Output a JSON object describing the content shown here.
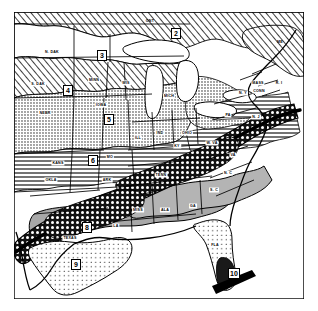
{
  "map": {
    "title": "Plant hardiness zone map of the eastern United States",
    "description": "Black and white line map of the central and eastern United States and southern Canada showing numbered climatic zones with hatch, stipple and gray fill patterns. A heavy dark band runs diagonally from Texas through the Appalachians to New England.",
    "style": "scanned black-and-white halftone map",
    "colors": {
      "background": "#ffffff",
      "ink": "#000000",
      "gray_light": "#d8d8d8",
      "gray_medium": "#a8a8a8",
      "gray_dark": "#7a7a7a",
      "water": "#ffffff"
    },
    "zones": [
      {
        "id": "zone-2",
        "label": "2",
        "region": "Ontario, Canada",
        "x": 172,
        "y": 25
      },
      {
        "id": "zone-3",
        "label": "3",
        "region": "North Dakota / northern plains",
        "x": 98,
        "y": 47
      },
      {
        "id": "zone-4",
        "label": "4",
        "region": "South Dakota / upper midwest",
        "x": 64,
        "y": 87
      },
      {
        "id": "zone-5",
        "label": "5",
        "region": "Iowa / central plains",
        "x": 104,
        "y": 120
      },
      {
        "id": "zone-6",
        "label": "6",
        "region": "Kansas / Missouri",
        "x": 89,
        "y": 159
      },
      {
        "id": "zone-7",
        "label": "7",
        "region": "Ontario northern band",
        "x": 172,
        "y": 25
      },
      {
        "id": "zone-8",
        "label": "8",
        "region": "East Texas",
        "x": 83,
        "y": 226
      },
      {
        "id": "zone-9",
        "label": "9",
        "region": "South Texas",
        "x": 72,
        "y": 262
      },
      {
        "id": "zone-10",
        "label": "10",
        "region": "South Florida",
        "x": 231,
        "y": 271
      }
    ],
    "zone_boxes": [
      {
        "label": "2",
        "x": 171,
        "y": 28
      },
      {
        "label": "3",
        "x": 97,
        "y": 50
      },
      {
        "label": "4",
        "x": 63,
        "y": 85
      },
      {
        "label": "5",
        "x": 104,
        "y": 114
      },
      {
        "label": "6",
        "x": 88,
        "y": 155
      },
      {
        "label": "8",
        "x": 82,
        "y": 222
      },
      {
        "label": "9",
        "x": 71,
        "y": 259
      },
      {
        "label": "10",
        "x": 228,
        "y": 268
      }
    ],
    "state_labels": [
      {
        "abbr": "N. DAK",
        "x": 52,
        "y": 52
      },
      {
        "abbr": "S. DAK",
        "x": 38,
        "y": 84
      },
      {
        "abbr": "MINN",
        "x": 94,
        "y": 80
      },
      {
        "abbr": "NEBR",
        "x": 45,
        "y": 113
      },
      {
        "abbr": "IOWA",
        "x": 101,
        "y": 105
      },
      {
        "abbr": "WIS",
        "x": 126,
        "y": 83
      },
      {
        "abbr": "MICH",
        "x": 169,
        "y": 96
      },
      {
        "abbr": "KANS",
        "x": 58,
        "y": 163
      },
      {
        "abbr": "MO",
        "x": 110,
        "y": 157
      },
      {
        "abbr": "OKLA",
        "x": 51,
        "y": 180
      },
      {
        "abbr": "ARK",
        "x": 107,
        "y": 180
      },
      {
        "abbr": "ILL",
        "x": 138,
        "y": 138
      },
      {
        "abbr": "IND",
        "x": 160,
        "y": 133
      },
      {
        "abbr": "OHIO",
        "x": 187,
        "y": 133
      },
      {
        "abbr": "KY",
        "x": 177,
        "y": 146
      },
      {
        "abbr": "W. VA",
        "x": 212,
        "y": 143
      },
      {
        "abbr": "PA",
        "x": 228,
        "y": 115
      },
      {
        "abbr": "TENN",
        "x": 161,
        "y": 175
      },
      {
        "abbr": "MISS",
        "x": 138,
        "y": 210
      },
      {
        "abbr": "ALA",
        "x": 165,
        "y": 210
      },
      {
        "abbr": "GA",
        "x": 193,
        "y": 206
      },
      {
        "abbr": "LA",
        "x": 116,
        "y": 226
      },
      {
        "abbr": "TEXAS",
        "x": 70,
        "y": 238
      },
      {
        "abbr": "FLA",
        "x": 215,
        "y": 245
      },
      {
        "abbr": "S. C",
        "x": 214,
        "y": 190
      },
      {
        "abbr": "N. C",
        "x": 228,
        "y": 173
      },
      {
        "abbr": "VA",
        "x": 233,
        "y": 155
      },
      {
        "abbr": "N. Y",
        "x": 243,
        "y": 93
      },
      {
        "abbr": "N. J",
        "x": 256,
        "y": 117
      },
      {
        "abbr": "MASS",
        "x": 258,
        "y": 83
      },
      {
        "abbr": "CONN",
        "x": 259,
        "y": 91
      },
      {
        "abbr": "R. I",
        "x": 279,
        "y": 83
      },
      {
        "abbr": "ME",
        "x": 280,
        "y": 42
      },
      {
        "abbr": "ONT",
        "x": 150,
        "y": 21
      }
    ]
  }
}
